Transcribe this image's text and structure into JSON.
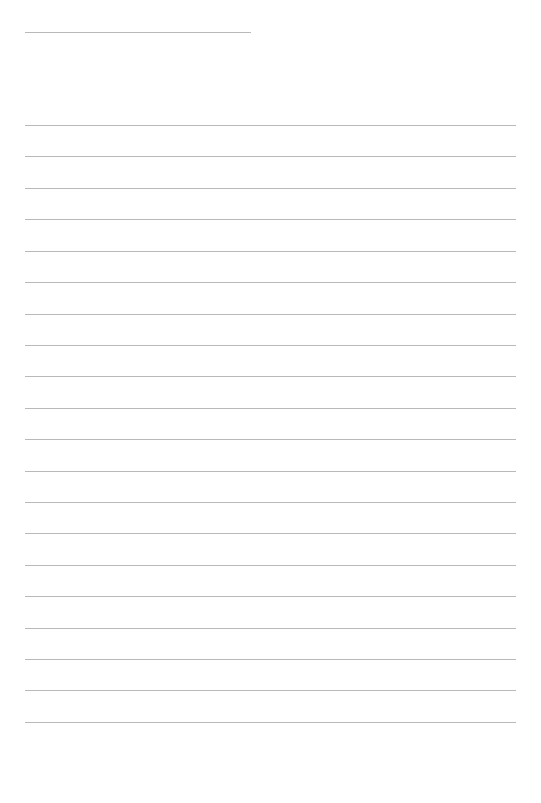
{
  "page": {
    "name": "blank-lined-writing-paper",
    "width": 541,
    "height": 803,
    "background_color": "#ffffff"
  },
  "rules": {
    "color": "#b9b9b9",
    "thickness_px": 1,
    "left_margin_px": 25,
    "right_edge_px": 516
  },
  "title_rule": {
    "label": "",
    "x_start": 25,
    "x_end": 251,
    "width": 226,
    "y": 32
  },
  "body_rules": {
    "count": 20,
    "x_start": 25,
    "x_end": 516,
    "width": 491,
    "first_y": 125,
    "spacing": 31.4,
    "y_positions": [
      125,
      156,
      188,
      219,
      251,
      282,
      314,
      345,
      376,
      408,
      439,
      471,
      502,
      533,
      565,
      596,
      628,
      659,
      690,
      722
    ],
    "last_y": 759,
    "lines": [
      {
        "index": 1,
        "text": ""
      },
      {
        "index": 2,
        "text": ""
      },
      {
        "index": 3,
        "text": ""
      },
      {
        "index": 4,
        "text": ""
      },
      {
        "index": 5,
        "text": ""
      },
      {
        "index": 6,
        "text": ""
      },
      {
        "index": 7,
        "text": ""
      },
      {
        "index": 8,
        "text": ""
      },
      {
        "index": 9,
        "text": ""
      },
      {
        "index": 10,
        "text": ""
      },
      {
        "index": 11,
        "text": ""
      },
      {
        "index": 12,
        "text": ""
      },
      {
        "index": 13,
        "text": ""
      },
      {
        "index": 14,
        "text": ""
      },
      {
        "index": 15,
        "text": ""
      },
      {
        "index": 16,
        "text": ""
      },
      {
        "index": 17,
        "text": ""
      },
      {
        "index": 18,
        "text": ""
      },
      {
        "index": 19,
        "text": ""
      },
      {
        "index": 20,
        "text": ""
      }
    ]
  }
}
